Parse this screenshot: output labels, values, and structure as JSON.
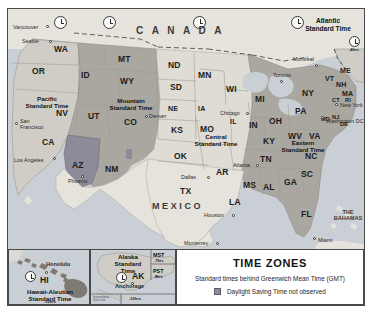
{
  "legend": {
    "title": "TIME ZONES",
    "subtitle": "Standard times behind Greenwich Mean Time (GMT)",
    "dst_note": "Daylight Saving Time not observed",
    "dst_swatch_color": "#8e8a99"
  },
  "palette": {
    "pacific": "#cfcdc6",
    "mountain": "#a9a7a0",
    "central": "#dfdcd5",
    "eastern": "#a9a7a0",
    "atlantic": "#cfcdc6",
    "no_dst": "#8e8a99",
    "water": "#c9cfd4",
    "land_outside": "#e6e3dc",
    "border": "#4a4a4a"
  },
  "zones": [
    {
      "name": "Pacific\nStandard Time",
      "line1": "Pacific",
      "line2": "Standard Time"
    },
    {
      "name": "Mountain\nStandard Time",
      "line1": "Mountain",
      "line2": "Standard Time"
    },
    {
      "name": "Central\nStandard Time",
      "line1": "Central",
      "line2": "Standard Time"
    },
    {
      "name": "Eastern\nStandard Time",
      "line1": "Eastern",
      "line2": "Standard Time"
    },
    {
      "name": "Atlantic\nStandard Time",
      "line1": "Atlantic",
      "line2": "Standard Time"
    }
  ],
  "zone_labels": {
    "pacific_l1": "Pacific",
    "pacific_l2": "Standard Time",
    "mountain_l1": "Mountain",
    "mountain_l2": "Standard Time",
    "central_l1": "Central",
    "central_l2": "Standard Time",
    "eastern_l1": "Eastern",
    "eastern_l2": "Standard Time",
    "atlantic_l1": "Atlantic",
    "atlantic_l2": "Standard Time"
  },
  "countries": {
    "canada": "C A N A D A",
    "mexico": "MEXICO",
    "bahamas_l1": "THE",
    "bahamas_l2": "BAHAMAS"
  },
  "offsets": {
    "atlantic": "-4hrs"
  },
  "states": [
    {
      "code": "WA",
      "x": 46,
      "y": 41
    },
    {
      "code": "OR",
      "x": 30,
      "y": 63
    },
    {
      "code": "ID",
      "x": 79,
      "y": 66
    },
    {
      "code": "MT",
      "x": 117,
      "y": 51
    },
    {
      "code": "ND",
      "x": 168,
      "y": 58
    },
    {
      "code": "SD",
      "x": 170,
      "y": 79
    },
    {
      "code": "MN",
      "x": 198,
      "y": 67
    },
    {
      "code": "WI",
      "x": 225,
      "y": 80
    },
    {
      "code": "MI",
      "x": 254,
      "y": 90
    },
    {
      "code": "WY",
      "x": 118,
      "y": 76
    },
    {
      "code": "NV",
      "x": 54,
      "y": 104
    },
    {
      "code": "UT",
      "x": 86,
      "y": 107
    },
    {
      "code": "CO",
      "x": 122,
      "y": 113
    },
    {
      "code": "NE",
      "x": 166,
      "y": 99
    },
    {
      "code": "IA",
      "x": 196,
      "y": 99
    },
    {
      "code": "IL",
      "x": 228,
      "y": 112
    },
    {
      "code": "IN",
      "x": 248,
      "y": 116
    },
    {
      "code": "OH",
      "x": 268,
      "y": 112
    },
    {
      "code": "PA",
      "x": 293,
      "y": 102
    },
    {
      "code": "NY",
      "x": 300,
      "y": 84
    },
    {
      "code": "ME",
      "x": 337,
      "y": 62
    },
    {
      "code": "VT",
      "x": 322,
      "y": 70
    },
    {
      "code": "NH",
      "x": 332,
      "y": 76
    },
    {
      "code": "MA",
      "x": 340,
      "y": 85
    },
    {
      "code": "CT",
      "x": 330,
      "y": 93
    },
    {
      "code": "RI",
      "x": 343,
      "y": 93
    },
    {
      "code": "NJ",
      "x": 330,
      "y": 110
    },
    {
      "code": "DE",
      "x": 337,
      "y": 117
    },
    {
      "code": "MD",
      "x": 319,
      "y": 112
    },
    {
      "code": "WV",
      "x": 288,
      "y": 127
    },
    {
      "code": "VA",
      "x": 308,
      "y": 127
    },
    {
      "code": "KS",
      "x": 169,
      "y": 121
    },
    {
      "code": "MO",
      "x": 199,
      "y": 124
    },
    {
      "code": "KY",
      "x": 262,
      "y": 132
    },
    {
      "code": "TN",
      "x": 259,
      "y": 150
    },
    {
      "code": "NC",
      "x": 304,
      "y": 147
    },
    {
      "code": "SC",
      "x": 300,
      "y": 165
    },
    {
      "code": "GA",
      "x": 283,
      "y": 173
    },
    {
      "code": "AL",
      "x": 261,
      "y": 178
    },
    {
      "code": "MS",
      "x": 242,
      "y": 176
    },
    {
      "code": "AR",
      "x": 215,
      "y": 163
    },
    {
      "code": "LA",
      "x": 227,
      "y": 193
    },
    {
      "code": "OK",
      "x": 172,
      "y": 147
    },
    {
      "code": "TX",
      "x": 178,
      "y": 183
    },
    {
      "code": "NM",
      "x": 104,
      "y": 160
    },
    {
      "code": "AZ",
      "x": 71,
      "y": 157
    },
    {
      "code": "CA",
      "x": 40,
      "y": 133
    },
    {
      "code": "FL",
      "x": 299,
      "y": 205
    }
  ],
  "cities": [
    {
      "name": "Vancouver",
      "x": 9,
      "y": 20,
      "dx": 38,
      "dy": 16,
      "align": "left"
    },
    {
      "name": "Seattle",
      "x": 16,
      "y": 32,
      "dx": 41,
      "dy": 31,
      "align": "left"
    },
    {
      "name": "San\nFrancisco",
      "line1": "San",
      "line2": "Francisco",
      "x": 9,
      "y": 115,
      "dx": 7,
      "dy": 115
    },
    {
      "name": "Los Angeles",
      "x": 7,
      "y": 154,
      "dx": 45,
      "dy": 148,
      "align": "left"
    },
    {
      "name": "Phoenix",
      "x": 62,
      "y": 172,
      "dx": 73,
      "dy": 168
    },
    {
      "name": "Denver",
      "x": 141,
      "y": 108,
      "dx": 137,
      "dy": 107
    },
    {
      "name": "Chicago",
      "x": 203,
      "y": 102,
      "dx": 238,
      "dy": 104
    },
    {
      "name": "Dallas",
      "x": 172,
      "y": 168,
      "dx": 204,
      "dy": 168
    },
    {
      "name": "Houston",
      "x": 197,
      "y": 205,
      "dx": 229,
      "dy": 206
    },
    {
      "name": "Monterrey",
      "x": 174,
      "y": 233,
      "dx": 210,
      "dy": 234
    },
    {
      "name": "Atlanta",
      "x": 253,
      "y": 157,
      "dx": 226,
      "dy": 156
    },
    {
      "name": "Miami",
      "x": 307,
      "y": 229,
      "dx": 311,
      "dy": 231
    },
    {
      "name": "Washington DC",
      "x": 318,
      "y": 112,
      "dx": 322,
      "dy": 113
    },
    {
      "name": "New York",
      "x": 330,
      "y": 97,
      "dx": 334,
      "dy": 96
    },
    {
      "name": "Toronto",
      "x": 278,
      "y": 73,
      "dx": 272,
      "dy": 67
    },
    {
      "name": "Montreal",
      "x": 311,
      "y": 57,
      "dx": 293,
      "dy": 50
    },
    {
      "name": "Honolulu",
      "x": 40,
      "y": 257,
      "dx": 44,
      "dy": 249
    },
    {
      "name": "Anchorage",
      "x": 122,
      "y": 280,
      "dx": 109,
      "dy": 283
    }
  ],
  "clocks": [
    {
      "x": 52,
      "y": 13
    },
    {
      "x": 100,
      "y": 13
    },
    {
      "x": 189,
      "y": 13
    },
    {
      "x": 288,
      "y": 13
    },
    {
      "x": 350,
      "y": 30
    },
    {
      "x": 25,
      "y": 261
    },
    {
      "x": 112,
      "y": 268
    }
  ],
  "insets": {
    "hawaii": {
      "label_l1": "Hawaii-Aleutian",
      "label_l2": "Standard Time",
      "offset": "-10hrs",
      "state_code": "HI",
      "city": "Honolulu"
    },
    "alaska": {
      "label_l1": "Alaska",
      "label_l2": "Standard",
      "label_l3": "Time",
      "state_code": "AK",
      "city": "Anchorage",
      "mst_code": "MST",
      "mst_offset": "-7hrs",
      "pst_code": "PST",
      "pst_offset": "-8hrs",
      "idl_l1": "International",
      "idl_l2": "Date Line",
      "idl_offset": "-10hrs"
    }
  }
}
